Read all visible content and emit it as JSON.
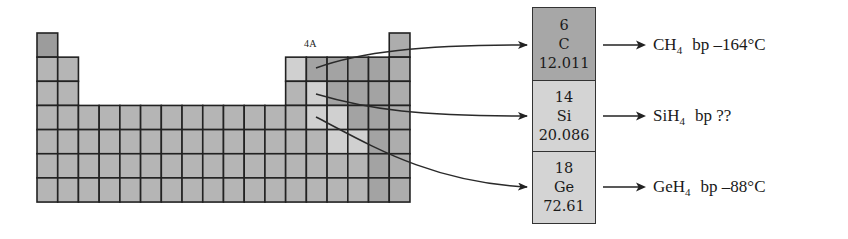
{
  "figure": {
    "group_label": "4A",
    "periodic_table": {
      "origin": {
        "x": 37,
        "y": 33
      },
      "cell_width": 20.72,
      "cell_height": 24.15,
      "columns": 18,
      "rows": 7,
      "colors": {
        "H": "#9c9c9c",
        "metal": "#b5b5b5",
        "metalloid": "#d0d0d0",
        "nonmetal": "#a3a3a3",
        "noble": "#adadad",
        "border": "#222222"
      },
      "layout": [
        [
          "H",
          "",
          "",
          "",
          "",
          "",
          "",
          "",
          "",
          "",
          "",
          "",
          "",
          "",
          "",
          "",
          "",
          "noble"
        ],
        [
          "metal",
          "metal",
          "",
          "",
          "",
          "",
          "",
          "",
          "",
          "",
          "",
          "",
          "metalloid",
          "nonmetal",
          "nonmetal",
          "nonmetal",
          "nonmetal",
          "noble"
        ],
        [
          "metal",
          "metal",
          "",
          "",
          "",
          "",
          "",
          "",
          "",
          "",
          "",
          "",
          "metal",
          "metalloid",
          "nonmetal",
          "nonmetal",
          "nonmetal",
          "noble"
        ],
        [
          "metal",
          "metal",
          "metal",
          "metal",
          "metal",
          "metal",
          "metal",
          "metal",
          "metal",
          "metal",
          "metal",
          "metal",
          "metal",
          "metalloid",
          "metalloid",
          "nonmetal",
          "nonmetal",
          "noble"
        ],
        [
          "metal",
          "metal",
          "metal",
          "metal",
          "metal",
          "metal",
          "metal",
          "metal",
          "metal",
          "metal",
          "metal",
          "metal",
          "metal",
          "metal",
          "metalloid",
          "metalloid",
          "nonmetal",
          "noble"
        ],
        [
          "metal",
          "metal",
          "metal",
          "metal",
          "metal",
          "metal",
          "metal",
          "metal",
          "metal",
          "metal",
          "metal",
          "metal",
          "metal",
          "metal",
          "metal",
          "metal",
          "nonmetal",
          "noble"
        ],
        [
          "metal",
          "metal",
          "metal",
          "metal",
          "metal",
          "metal",
          "metal",
          "metal",
          "metal",
          "metal",
          "metal",
          "metal",
          "metal",
          "metal",
          "metal",
          "metal",
          "nonmetal",
          "noble"
        ]
      ]
    },
    "elements": [
      {
        "number": "6",
        "symbol": "C",
        "mass": "12.011",
        "color": "#a7a7a7"
      },
      {
        "number": "14",
        "symbol": "Si",
        "mass": "20.086",
        "color": "#d4d4d4"
      },
      {
        "number": "18",
        "symbol": "Ge",
        "mass": "72.61",
        "color": "#d4d4d4"
      }
    ],
    "connectors": [
      {
        "from": [
          316,
          68
        ],
        "to": [
          527,
          45
        ],
        "path": "M316,68 C360,52 420,45 527,45"
      },
      {
        "from": [
          316,
          94
        ],
        "to": [
          527,
          116
        ],
        "path": "M316,94 C370,110 420,116 527,116"
      },
      {
        "from": [
          316,
          117
        ],
        "to": [
          527,
          187
        ],
        "path": "M316,117 C370,145 430,182 527,187"
      }
    ],
    "products": [
      {
        "formula_base": "CH",
        "formula_sub": "4",
        "bp_label": "bp –164°C",
        "top": 33
      },
      {
        "formula_base": "SiH",
        "formula_sub": "4",
        "bp_label": "bp ??",
        "top": 104
      },
      {
        "formula_base": "GeH",
        "formula_sub": "4",
        "bp_label": "bp –88°C",
        "top": 175
      }
    ]
  }
}
